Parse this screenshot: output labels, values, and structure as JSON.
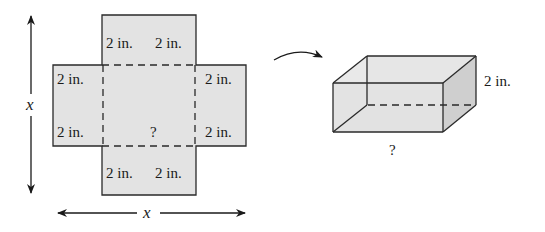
{
  "net": {
    "top_flap_labels": [
      "2 in.",
      "2 in."
    ],
    "bottom_flap_labels": [
      "2 in.",
      "2 in."
    ],
    "left_flap_labels": [
      "2 in.",
      "2 in."
    ],
    "right_flap_labels": [
      "2 in.",
      "2 in."
    ],
    "center_label": "?",
    "vertical_dimension": "x",
    "horizontal_dimension": "x"
  },
  "box": {
    "height_label": "2 in.",
    "base_label": "?"
  },
  "colors": {
    "fill": "#e3e3e3",
    "side_fill": "#cfcfcf",
    "stroke": "#2a2a2a"
  }
}
